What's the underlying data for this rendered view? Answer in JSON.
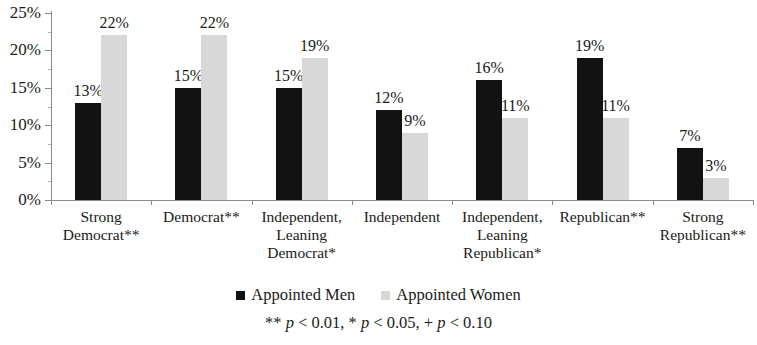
{
  "chart_data": {
    "type": "bar",
    "title": "",
    "subtitle": "",
    "xlabel": "",
    "ylabel": "",
    "ylim": [
      0,
      25
    ],
    "y_unit": "%",
    "grid": false,
    "legend_position": "bottom",
    "categories": [
      "Strong\nDemocrat**",
      "Democrat**",
      "Independent,\nLeaning\nDemocrat*",
      "Independent",
      "Independent,\nLeaning\nRepublican*",
      "Republican**",
      "Strong\nRepublican**"
    ],
    "ytick_labels": [
      "25%",
      "20%",
      "15%",
      "10%",
      "5%",
      "0%"
    ],
    "ytick_values": [
      25,
      20,
      15,
      10,
      5,
      0
    ],
    "series": [
      {
        "name": "Appointed Men",
        "color": "#121212",
        "values": [
          13,
          15,
          15,
          12,
          16,
          19,
          7
        ],
        "labels": [
          "13%",
          "15%",
          "15%",
          "12%",
          "16%",
          "19%",
          "7%"
        ]
      },
      {
        "name": "Appointed Women",
        "color": "#d8d8d8",
        "values": [
          22,
          22,
          19,
          9,
          11,
          11,
          3
        ],
        "labels": [
          "22%",
          "22%",
          "19%",
          "9%",
          "11%",
          "11%",
          "3%"
        ]
      }
    ],
    "annotations": [
      "** p < 0.01, * p < 0.05, + p < 0.10"
    ]
  },
  "legend": {
    "items": [
      {
        "label": "Appointed Men"
      },
      {
        "label": "Appointed Women"
      }
    ]
  },
  "footnote": {
    "prefix_a": "** ",
    "p_a": "p",
    "text_a": " < 0.01, * ",
    "p_b": "p",
    "text_b": " < 0.05, + ",
    "p_c": "p",
    "text_c": " < 0.10"
  }
}
